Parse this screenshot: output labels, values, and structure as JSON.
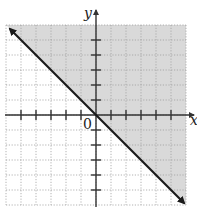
{
  "chart_data": {
    "type": "line",
    "title": "",
    "xlabel": "x",
    "ylabel": "y",
    "origin_label": "0",
    "xlim": [
      -6,
      6
    ],
    "ylim": [
      -6,
      6
    ],
    "grid": true,
    "grid_style": "dotted",
    "tick_spacing": 1,
    "x_ticks": [
      -5,
      -4,
      -3,
      -2,
      -1,
      1,
      2,
      3,
      4,
      5
    ],
    "y_ticks": [
      -5,
      -4,
      -3,
      -2,
      -1,
      1,
      2,
      3,
      4,
      5
    ],
    "series": [
      {
        "name": "boundary line y = -x",
        "equation": "y = -x",
        "style": "solid",
        "arrows": "both",
        "x": [
          -6,
          6
        ],
        "y": [
          6,
          -6
        ]
      }
    ],
    "shaded_region": {
      "description": "half-plane above the line (y >= -x)",
      "inequality": "y >= -x",
      "color": "#d9d9d9"
    }
  },
  "colors": {
    "line": "#1a1a1a",
    "axis": "#333333",
    "grid": "#a0a0a0",
    "shade": "#d9d9d9",
    "background": "#ffffff"
  }
}
